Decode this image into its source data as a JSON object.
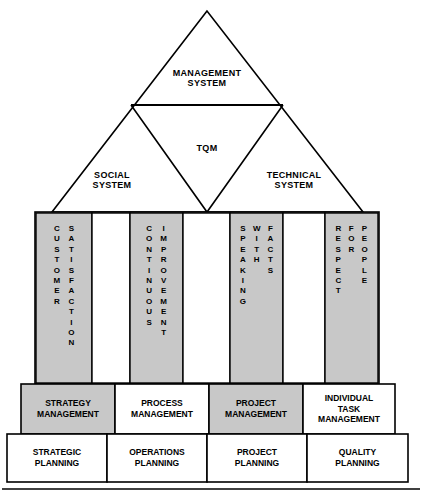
{
  "diagram": {
    "colors": {
      "line": "#000000",
      "fill_shaded": "#c8c8c8",
      "fill_plain": "#ffffff",
      "background": "#ffffff"
    },
    "apex": {
      "label": "MANAGEMENT\nSYSTEM"
    },
    "core": {
      "label": "TQM"
    },
    "wings": [
      {
        "label": "SOCIAL\nSYSTEM"
      },
      {
        "label": "TECHNICAL\nSYSTEM"
      }
    ],
    "pillars": [
      {
        "shaded": true,
        "words": [
          "CUSTOMER",
          "SATISFACTION"
        ]
      },
      {
        "shaded": false,
        "words": []
      },
      {
        "shaded": true,
        "words": [
          "CONTINUOUS",
          "IMPROVEMENT"
        ]
      },
      {
        "shaded": false,
        "words": []
      },
      {
        "shaded": true,
        "words": [
          "SPEAKING",
          "WITH",
          "FACTS"
        ]
      },
      {
        "shaded": false,
        "words": []
      },
      {
        "shaded": true,
        "words": [
          "RESPECT",
          "FOR",
          "PEOPLE"
        ]
      }
    ],
    "management_row": [
      {
        "label": "STRATEGY\nMANAGEMENT",
        "shaded": true
      },
      {
        "label": "PROCESS\nMANAGEMENT",
        "shaded": false
      },
      {
        "label": "PROJECT\nMANAGEMENT",
        "shaded": true
      },
      {
        "label": "INDIVIDUAL\nTASK\nMANAGEMENT",
        "shaded": false
      }
    ],
    "planning_row": [
      {
        "label": "STRATEGIC\nPLANNING",
        "shaded": false
      },
      {
        "label": "OPERATIONS\nPLANNING",
        "shaded": false
      },
      {
        "label": "PROJECT\nPLANNING",
        "shaded": false
      },
      {
        "label": "QUALITY\nPLANNING",
        "shaded": false
      }
    ]
  }
}
